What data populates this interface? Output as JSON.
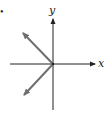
{
  "figure": {
    "bullet": "•",
    "axes": {
      "x_label": "x",
      "y_label": "y",
      "axis_color": "#222222"
    },
    "vectors": [
      {
        "name": "upper-left-vector",
        "direction": "up-left",
        "color": "#6e6e6e"
      },
      {
        "name": "lower-left-vector",
        "direction": "down-left",
        "color": "#6e6e6e"
      }
    ]
  }
}
